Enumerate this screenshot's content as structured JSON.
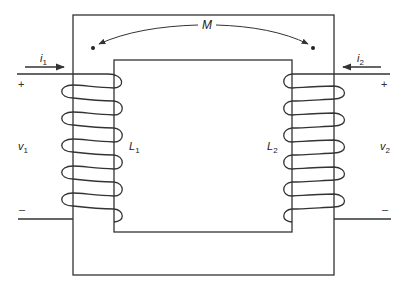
{
  "diagram": {
    "type": "transformer-mutual-inductance",
    "colors": {
      "stroke": "#333333",
      "background": "#ffffff"
    },
    "labels": {
      "mutual": "M",
      "primary_current": {
        "symbol": "i",
        "sub": "1"
      },
      "secondary_current": {
        "symbol": "i",
        "sub": "2"
      },
      "primary_voltage": {
        "symbol": "v",
        "sub": "1"
      },
      "secondary_voltage": {
        "symbol": "v",
        "sub": "2"
      },
      "primary_inductance": {
        "symbol": "L",
        "sub": "1"
      },
      "secondary_inductance": {
        "symbol": "L",
        "sub": "2"
      },
      "plus": "+",
      "minus": "–"
    },
    "primary_coil_turns": 6,
    "secondary_coil_turns": 6,
    "dots": [
      "primary-top",
      "secondary-top"
    ]
  }
}
